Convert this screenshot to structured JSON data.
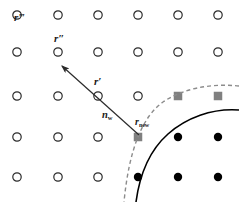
{
  "figure": {
    "width": 239,
    "height": 202,
    "background": "#ffffff"
  },
  "colors": {
    "open_node_stroke": "#2b2b2b",
    "filled_node": "#000000",
    "square_node": "#808080",
    "solid_curve": "#000000",
    "dashed_curve": "#8c8c8c",
    "arrow": "#2b2b2b",
    "label_text": "#1a1a1a"
  },
  "labels": [
    {
      "id": "r-triple-prime",
      "text": "r",
      "primes": "‴",
      "x": 14,
      "y": 12
    },
    {
      "id": "r-double-prime",
      "text": "r",
      "primes": "″",
      "x": 54,
      "y": 33
    },
    {
      "id": "r-prime",
      "text": "r",
      "primes": "′",
      "x": 94,
      "y": 76
    },
    {
      "id": "n-w",
      "text": "n",
      "subscript": "w",
      "x": 102,
      "y": 110
    },
    {
      "id": "r-new",
      "text": "r",
      "subscript": "new",
      "x": 135,
      "y": 117
    }
  ],
  "lattice": {
    "columns_x": [
      17,
      58,
      98,
      138,
      178,
      218
    ],
    "rows_y": [
      15,
      52,
      96,
      137,
      177
    ],
    "open_radius": 4.2,
    "filled_radius": 4.2,
    "square_size": 8.5,
    "nodes": [
      {
        "row": 0,
        "col": 0,
        "type": "open"
      },
      {
        "row": 0,
        "col": 1,
        "type": "open"
      },
      {
        "row": 0,
        "col": 2,
        "type": "open"
      },
      {
        "row": 0,
        "col": 3,
        "type": "open"
      },
      {
        "row": 0,
        "col": 4,
        "type": "open"
      },
      {
        "row": 0,
        "col": 5,
        "type": "open"
      },
      {
        "row": 1,
        "col": 0,
        "type": "open"
      },
      {
        "row": 1,
        "col": 1,
        "type": "open"
      },
      {
        "row": 1,
        "col": 2,
        "type": "open"
      },
      {
        "row": 1,
        "col": 3,
        "type": "open"
      },
      {
        "row": 1,
        "col": 4,
        "type": "open"
      },
      {
        "row": 1,
        "col": 5,
        "type": "open"
      },
      {
        "row": 2,
        "col": 0,
        "type": "open"
      },
      {
        "row": 2,
        "col": 1,
        "type": "open"
      },
      {
        "row": 2,
        "col": 2,
        "type": "open"
      },
      {
        "row": 2,
        "col": 3,
        "type": "open"
      },
      {
        "row": 2,
        "col": 4,
        "type": "square"
      },
      {
        "row": 2,
        "col": 5,
        "type": "square"
      },
      {
        "row": 3,
        "col": 0,
        "type": "open"
      },
      {
        "row": 3,
        "col": 1,
        "type": "open"
      },
      {
        "row": 3,
        "col": 2,
        "type": "open"
      },
      {
        "row": 3,
        "col": 3,
        "type": "square"
      },
      {
        "row": 3,
        "col": 4,
        "type": "filled"
      },
      {
        "row": 3,
        "col": 5,
        "type": "filled"
      },
      {
        "row": 4,
        "col": 0,
        "type": "open"
      },
      {
        "row": 4,
        "col": 1,
        "type": "open"
      },
      {
        "row": 4,
        "col": 2,
        "type": "open"
      },
      {
        "row": 4,
        "col": 3,
        "type": "filled"
      },
      {
        "row": 4,
        "col": 4,
        "type": "filled"
      },
      {
        "row": 4,
        "col": 5,
        "type": "filled"
      }
    ]
  },
  "curves": {
    "solid": {
      "name": "wall-boundary-solid",
      "path": "M 239 110 C 212 108 186 118 168 134 C 150 150 140 172 136 202",
      "stroke": "#000000",
      "width": 1.6,
      "dash": "none"
    },
    "dashed": {
      "name": "wall-boundary-dashed",
      "path": "M 239 86 C 210 83 182 89 163 102 C 142 117 129 150 124 202",
      "stroke": "#8c8c8c",
      "width": 1.4,
      "dash": "4 3"
    }
  },
  "arrow": {
    "name": "normal-vector-arrow",
    "from_x": 139,
    "from_y": 135,
    "to_x": 62,
    "to_y": 66,
    "stroke": "#2b2b2b",
    "width": 1.2,
    "head_length": 9,
    "head_width": 5
  }
}
